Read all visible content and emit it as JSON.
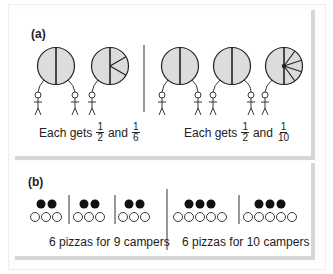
{
  "figure": {
    "colors": {
      "pie_fill": "#dcdcdc",
      "stroke": "#222222",
      "pizza_dot": "#111111",
      "camper_circle": "#ffffff",
      "panel_shadow": "#d6d6d6"
    },
    "panel_a": {
      "label": "(a)",
      "scenarios": [
        {
          "pies": [
            {
              "cx": 56,
              "cy": 66,
              "r": 18.5,
              "slices": "halves"
            },
            {
              "cx": 110,
              "cy": 66,
              "r": 18.5,
              "slices": "half-and-sixths"
            }
          ],
          "campers": 3,
          "caption": {
            "prefix": "Each gets",
            "frac1_num": "1",
            "frac1_den": "2",
            "conj": "and",
            "frac2_num": "1",
            "frac2_den": "6"
          }
        },
        {
          "pies": [
            {
              "cx": 180,
              "cy": 66,
              "r": 18.5,
              "slices": "halves"
            },
            {
              "cx": 232,
              "cy": 66,
              "r": 18.5,
              "slices": "halves"
            },
            {
              "cx": 284,
              "cy": 66,
              "r": 18.5,
              "slices": "half-and-tenths"
            }
          ],
          "campers": 5,
          "caption": {
            "prefix": "Each gets",
            "frac1_num": "1",
            "frac1_den": "2",
            "conj": "and",
            "frac2_num": "1",
            "frac2_den": "10"
          }
        }
      ]
    },
    "panel_b": {
      "label": "(b)",
      "scenarios": [
        {
          "groups": [
            {
              "pizzas": 2,
              "campers": 3
            },
            {
              "pizzas": 2,
              "campers": 3
            },
            {
              "pizzas": 2,
              "campers": 3
            }
          ],
          "caption": "6 pizzas for 9 campers"
        },
        {
          "groups": [
            {
              "pizzas": 3,
              "campers": 5
            },
            {
              "pizzas": 3,
              "campers": 5
            }
          ],
          "caption": "6 pizzas for 10 campers"
        }
      ]
    }
  }
}
